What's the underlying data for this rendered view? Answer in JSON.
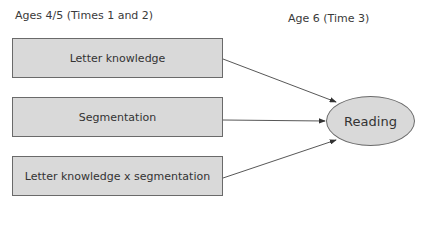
{
  "headers": {
    "left": "Ages 4/5 (Times 1 and 2)",
    "right": "Age 6 (Time 3)"
  },
  "predictors": [
    {
      "label": "Letter knowledge"
    },
    {
      "label": "Segmentation"
    },
    {
      "label": "Letter knowledge x segmentation"
    }
  ],
  "outcome": {
    "label": "Reading"
  },
  "colors": {
    "box_fill": "#d9d9d9",
    "border": "#6a6a6a",
    "arrow": "#333333"
  }
}
